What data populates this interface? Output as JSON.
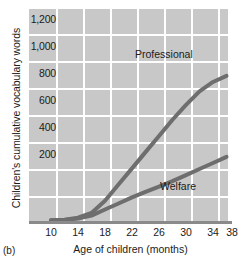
{
  "figure": {
    "panel_caption": "(b)",
    "background_color": "#ffffff",
    "plot_area_color": "#c8c8c8",
    "gridline_color": "#ffffff",
    "axis_color": "#8a8a8a",
    "line_color": "#6e6e6e",
    "text_color": "#1b1b1b"
  },
  "chart_data": {
    "type": "line",
    "title": "",
    "xlabel": "Age of children (months)",
    "ylabel": "Children's cumulative vocabulary words",
    "xlim": [
      8,
      38
    ],
    "ylim": [
      0,
      1300
    ],
    "xticks": [
      10,
      14,
      18,
      22,
      26,
      30,
      34,
      38
    ],
    "xticklabels": [
      "10",
      "14",
      "18",
      "22",
      "26",
      "30",
      "34",
      "38"
    ],
    "yticks": [
      200,
      400,
      600,
      800,
      1000,
      1200
    ],
    "yticklabels": [
      "200",
      "400",
      "600",
      "800",
      "1,000",
      "1,200"
    ],
    "grid": true,
    "grid_axis": "both",
    "legend_position": "inline-annotations",
    "x": [
      10,
      12,
      14,
      16,
      18,
      20,
      22,
      24,
      26,
      28,
      30,
      32,
      34,
      36
    ],
    "series": [
      {
        "name": "Professional",
        "label": "Professional",
        "color": "#6e6e6e",
        "values": [
          5,
          10,
          25,
          60,
          150,
          270,
          390,
          510,
          630,
          750,
          860,
          960,
          1030,
          1075
        ]
      },
      {
        "name": "Welfare",
        "label": "Welfare",
        "color": "#6e6e6e",
        "values": [
          5,
          8,
          18,
          40,
          85,
          130,
          175,
          215,
          255,
          295,
          340,
          385,
          430,
          475
        ]
      }
    ],
    "annotations": [
      {
        "text": "Professional",
        "x": 25.0,
        "y": 1060
      },
      {
        "text": "Welfare",
        "x": 29.0,
        "y": 205
      }
    ]
  }
}
